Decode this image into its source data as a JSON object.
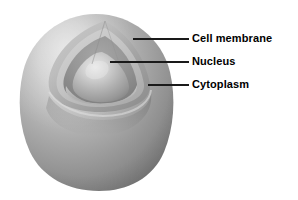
{
  "figure": {
    "background_color": "#ffffff",
    "label_color": "#000000",
    "leader_line_color": "#1a1a1a"
  },
  "diagram": {
    "style": "grayscale-shaded-3d-cutaway",
    "colors": {
      "membrane_light": "#d8d8d8",
      "membrane_mid": "#a9a9a9",
      "membrane_dark": "#7d7d7d",
      "membrane_shadow": "#6b6b6b",
      "cytoplasm_light": "#d2d2d2",
      "cytoplasm_mid": "#b0b0b0",
      "cytoplasm_dark": "#8c8c8c",
      "interior_dark": "#8f8f8f",
      "nucleus_light": "#e0e0e0",
      "nucleus_mid": "#b4b4b4",
      "nucleus_dark": "#8a8a8a"
    },
    "parts": [
      {
        "id": "cell-membrane",
        "name": "Cell membrane"
      },
      {
        "id": "nucleus",
        "name": "Nucleus"
      },
      {
        "id": "cytoplasm",
        "name": "Cytoplasm"
      }
    ]
  },
  "callouts": [
    {
      "id": "cell-membrane",
      "label": "Cell membrane",
      "leader": {
        "x1": 133,
        "y1": 39,
        "x2": 189,
        "y2": 39
      }
    },
    {
      "id": "nucleus",
      "label": "Nucleus",
      "leader": {
        "x1": 110,
        "y1": 62,
        "x2": 189,
        "y2": 62
      }
    },
    {
      "id": "cytoplasm",
      "label": "Cytoplasm",
      "leader": {
        "x1": 148,
        "y1": 85,
        "x2": 189,
        "y2": 85
      }
    }
  ]
}
